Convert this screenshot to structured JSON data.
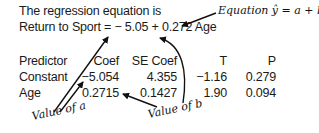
{
  "equation": {
    "intro": "The regression equation is",
    "formula": "Return to Sport = − 5.05 + 0.272 Age"
  },
  "table": {
    "headers": [
      "Predictor",
      "Coef",
      "SE Coef",
      "T",
      "P"
    ],
    "rows": [
      [
        "Constant",
        "−5.054",
        "4.355",
        "−1.16",
        "0.279"
      ],
      [
        "Age",
        "0.2715",
        "0.1427",
        "1.90",
        "0.094"
      ]
    ]
  },
  "annotations": {
    "equation_label": "Equation ŷ = a + bx",
    "value_a": "Value of a",
    "value_b": "Value of b"
  }
}
